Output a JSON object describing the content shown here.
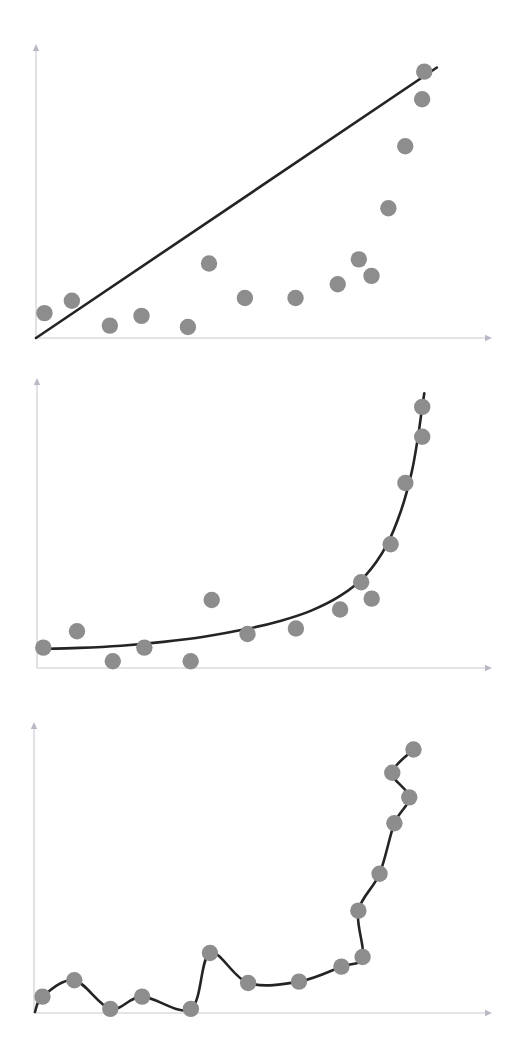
{
  "figure": {
    "background_color": "#ffffff",
    "dot_color": "#8d8d8d",
    "curve_color": "#242424",
    "axis_color": "#c9c9d2",
    "dot_radius": 8.2,
    "curve_width": 2.6
  },
  "chart_data": [
    {
      "type": "scatter",
      "name": "underfitting",
      "title": "",
      "subtitle": "",
      "xlabel": "",
      "ylabel": "",
      "grid": false,
      "legend": "none",
      "xlim": [
        0,
        100
      ],
      "ylim": [
        0,
        100
      ],
      "axis": {
        "origin_x": 36,
        "origin_y": 338,
        "x_end": 492,
        "y_end": 44
      },
      "points": [
        {
          "x": 2.0,
          "y": 9.0
        },
        {
          "x": 8.5,
          "y": 13.5
        },
        {
          "x": 17.5,
          "y": 4.5
        },
        {
          "x": 25.0,
          "y": 8.0
        },
        {
          "x": 36.0,
          "y": 4.0
        },
        {
          "x": 41.0,
          "y": 27.0
        },
        {
          "x": 49.5,
          "y": 14.5
        },
        {
          "x": 61.5,
          "y": 14.5
        },
        {
          "x": 71.5,
          "y": 19.5
        },
        {
          "x": 76.5,
          "y": 28.5
        },
        {
          "x": 79.5,
          "y": 22.5
        },
        {
          "x": 83.5,
          "y": 47.0
        },
        {
          "x": 87.5,
          "y": 69.5
        },
        {
          "x": 91.5,
          "y": 86.5
        },
        {
          "x": 92.0,
          "y": 96.5
        }
      ],
      "fit": {
        "kind": "line",
        "description": "straight regression line, underfits the curved trend",
        "x_start": 0.0,
        "y_start": 0.0,
        "x_end": 95.0,
        "y_end": 98.0
      }
    },
    {
      "type": "scatter",
      "name": "good-fit",
      "title": "",
      "subtitle": "",
      "xlabel": "",
      "ylabel": "",
      "grid": false,
      "legend": "none",
      "xlim": [
        0,
        100
      ],
      "ylim": [
        0,
        100
      ],
      "axis": {
        "origin_x": 37,
        "origin_y": 668,
        "x_end": 492,
        "y_end": 378
      },
      "points": [
        {
          "x": 1.5,
          "y": 7.5
        },
        {
          "x": 9.5,
          "y": 13.5
        },
        {
          "x": 18.0,
          "y": 2.5
        },
        {
          "x": 25.5,
          "y": 7.5
        },
        {
          "x": 36.5,
          "y": 2.5
        },
        {
          "x": 41.5,
          "y": 25.0
        },
        {
          "x": 50.0,
          "y": 12.5
        },
        {
          "x": 61.5,
          "y": 14.5
        },
        {
          "x": 72.0,
          "y": 21.5
        },
        {
          "x": 77.0,
          "y": 31.5
        },
        {
          "x": 79.5,
          "y": 25.5
        },
        {
          "x": 84.0,
          "y": 45.5
        },
        {
          "x": 87.5,
          "y": 68.0
        },
        {
          "x": 91.5,
          "y": 85.0
        },
        {
          "x": 91.5,
          "y": 96.0
        }
      ],
      "fit": {
        "kind": "exponential",
        "description": "smooth exponential curve, good fit through the data trend",
        "samples": [
          {
            "x": 0.0,
            "y": 7.0
          },
          {
            "x": 10.0,
            "y": 7.4
          },
          {
            "x": 20.0,
            "y": 8.2
          },
          {
            "x": 30.0,
            "y": 9.6
          },
          {
            "x": 40.0,
            "y": 11.6
          },
          {
            "x": 50.0,
            "y": 14.4
          },
          {
            "x": 58.0,
            "y": 17.4
          },
          {
            "x": 65.0,
            "y": 21.0
          },
          {
            "x": 72.0,
            "y": 26.5
          },
          {
            "x": 78.0,
            "y": 34.0
          },
          {
            "x": 83.0,
            "y": 45.0
          },
          {
            "x": 86.5,
            "y": 58.0
          },
          {
            "x": 89.0,
            "y": 72.0
          },
          {
            "x": 90.5,
            "y": 85.0
          },
          {
            "x": 91.5,
            "y": 96.0
          },
          {
            "x": 92.0,
            "y": 101.0
          }
        ]
      }
    },
    {
      "type": "scatter",
      "name": "overfitting",
      "title": "",
      "subtitle": "",
      "xlabel": "",
      "ylabel": "",
      "grid": false,
      "legend": "none",
      "xlim": [
        0,
        100
      ],
      "ylim": [
        0,
        100
      ],
      "axis": {
        "origin_x": 34,
        "origin_y": 1013,
        "x_end": 492,
        "y_end": 722
      },
      "points": [
        {
          "x": 2.0,
          "y": 6.0
        },
        {
          "x": 9.5,
          "y": 12.0
        },
        {
          "x": 18.0,
          "y": 1.5
        },
        {
          "x": 25.5,
          "y": 6.0
        },
        {
          "x": 37.0,
          "y": 1.5
        },
        {
          "x": 41.5,
          "y": 22.0
        },
        {
          "x": 50.5,
          "y": 11.0
        },
        {
          "x": 62.5,
          "y": 11.5
        },
        {
          "x": 72.5,
          "y": 17.0
        },
        {
          "x": 77.5,
          "y": 20.5
        },
        {
          "x": 76.5,
          "y": 37.5
        },
        {
          "x": 81.5,
          "y": 51.0
        },
        {
          "x": 85.0,
          "y": 69.5
        },
        {
          "x": 88.5,
          "y": 79.0
        },
        {
          "x": 84.5,
          "y": 88.0
        },
        {
          "x": 89.5,
          "y": 96.5
        }
      ],
      "fit": {
        "kind": "interpolating-spline",
        "description": "wiggly curve passing exactly through every point, overfits the noise",
        "passes_through_all_points": true
      }
    }
  ]
}
